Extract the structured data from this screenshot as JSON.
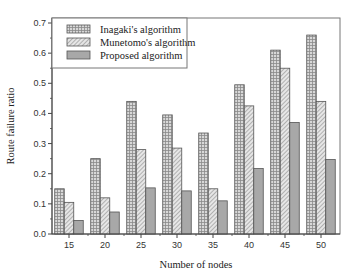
{
  "chart_data": {
    "type": "bar",
    "title": "",
    "xlabel": "Number of nodes",
    "ylabel": "Route failure ratio",
    "categories": [
      "15",
      "20",
      "25",
      "30",
      "35",
      "40",
      "45",
      "50"
    ],
    "series": [
      {
        "name": "Inagaki's algorithm",
        "pattern": "grid",
        "values": [
          0.15,
          0.25,
          0.44,
          0.395,
          0.335,
          0.495,
          0.61,
          0.66
        ]
      },
      {
        "name": "Munetomo's algorithm",
        "pattern": "hatch",
        "values": [
          0.105,
          0.12,
          0.28,
          0.285,
          0.15,
          0.425,
          0.55,
          0.44
        ]
      },
      {
        "name": "Proposed algorithm",
        "pattern": "solid",
        "values": [
          0.045,
          0.073,
          0.153,
          0.143,
          0.11,
          0.217,
          0.37,
          0.247
        ]
      }
    ],
    "ylim": [
      0,
      0.7
    ],
    "yticks": [
      "0.0",
      "0.1",
      "0.2",
      "0.3",
      "0.4",
      "0.5",
      "0.6",
      "0.7"
    ],
    "grid": false,
    "legend_position": "upper-left"
  },
  "colors": {
    "bar_fill": "#a8a8a8",
    "bar_stroke": "#555555",
    "axis": "#444444"
  }
}
